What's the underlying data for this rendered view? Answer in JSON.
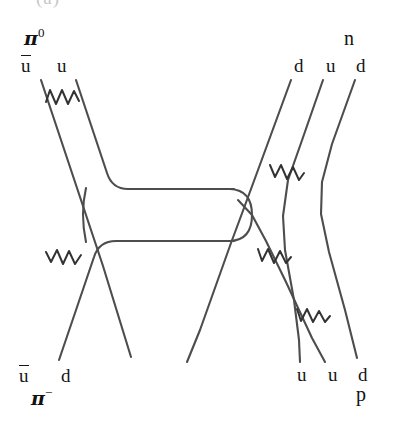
{
  "figure": {
    "background_color": "#ffffff",
    "line_color": "#4d4d4d",
    "text_color": "#151515",
    "cropped_top_caption": "(a)"
  },
  "labels": {
    "pi_zero": {
      "symbol": "π",
      "superscript": "0"
    },
    "pi_minus": {
      "symbol": "π",
      "superscript": "−"
    },
    "neutron": "n",
    "proton": "p",
    "ubar": "u",
    "u": "u",
    "d": "d"
  },
  "particles": {
    "incoming_meson": {
      "name": "pi-zero",
      "display": "π⁰",
      "quarks": [
        "ubar",
        "u"
      ],
      "position": "top-left"
    },
    "outgoing_meson": {
      "name": "pi-minus",
      "display": "π⁻",
      "quarks": [
        "ubar",
        "d"
      ],
      "position": "bottom-left"
    },
    "outgoing_baryon": {
      "name": "neutron",
      "display": "n",
      "quarks": [
        "d",
        "u",
        "d"
      ],
      "position": "top-right"
    },
    "incoming_baryon": {
      "name": "proton",
      "display": "p",
      "quarks": [
        "u",
        "u",
        "d"
      ],
      "position": "bottom-right"
    }
  },
  "quark_lines": [
    {
      "id": "pi0-ubar",
      "label": "u",
      "barred": true,
      "x": 28,
      "y": 66,
      "side": "top-left"
    },
    {
      "id": "pi0-u",
      "label": "u",
      "barred": false,
      "x": 63,
      "y": 66,
      "side": "top-left"
    },
    {
      "id": "n-d1",
      "label": "d",
      "barred": false,
      "x": 300,
      "y": 66,
      "side": "top-right"
    },
    {
      "id": "n-u",
      "label": "u",
      "barred": false,
      "x": 331,
      "y": 66,
      "side": "top-right"
    },
    {
      "id": "n-d2",
      "label": "d",
      "barred": false,
      "x": 362,
      "y": 66,
      "side": "top-right"
    },
    {
      "id": "pim-ubar",
      "label": "u",
      "barred": true,
      "x": 26,
      "y": 376,
      "side": "bottom-left"
    },
    {
      "id": "pim-d",
      "label": "d",
      "barred": false,
      "x": 67,
      "y": 376,
      "side": "bottom-left"
    },
    {
      "id": "p-u1",
      "label": "u",
      "barred": false,
      "x": 303,
      "y": 376,
      "side": "bottom-right"
    },
    {
      "id": "p-u2",
      "label": "u",
      "barred": false,
      "x": 334,
      "y": 376,
      "side": "bottom-right"
    },
    {
      "id": "p-d",
      "label": "d",
      "barred": false,
      "x": 364,
      "y": 376,
      "side": "bottom-right"
    }
  ],
  "gluons": [
    {
      "id": "gluon-top-left",
      "x": 62,
      "y": 98,
      "note": "between pi0 ubar and u"
    },
    {
      "id": "gluon-bottom-left",
      "x": 62,
      "y": 258,
      "note": "between pi- ubar and d"
    },
    {
      "id": "gluon-top-right",
      "x": 290,
      "y": 172,
      "note": "between neutron d and u"
    },
    {
      "id": "gluon-mid-right",
      "x": 272,
      "y": 256,
      "note": "between exchanged quark and proton u"
    },
    {
      "id": "gluon-bottom-right",
      "x": 318,
      "y": 314,
      "note": "between proton u and d"
    }
  ],
  "exchange": {
    "id": "quark-exchange-tube",
    "description": "horizontal quark-antiquark exchange tube with rounded right hairpin end",
    "left_x": 86,
    "right_x": 248,
    "top_y": 189,
    "bottom_y": 241
  }
}
